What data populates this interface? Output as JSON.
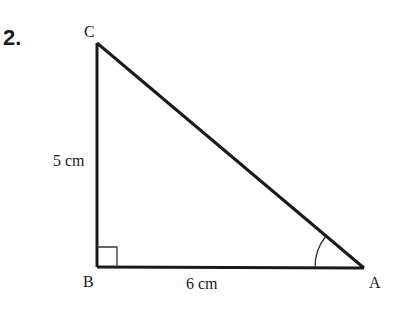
{
  "problem": {
    "number": "2."
  },
  "triangle": {
    "vertices": {
      "A": {
        "label": "A",
        "x": 364,
        "y": 268
      },
      "B": {
        "label": "B",
        "x": 97,
        "y": 267
      },
      "C": {
        "label": "C",
        "x": 97,
        "y": 43
      }
    },
    "sides": {
      "BC": {
        "label": "5 cm"
      },
      "BA": {
        "label": "6 cm"
      }
    },
    "right_angle_at": "B",
    "marked_angle_at": "A",
    "stroke_color": "#1a1a1a"
  }
}
